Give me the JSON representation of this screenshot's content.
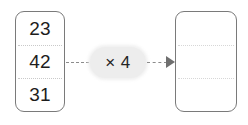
{
  "diagram": {
    "input_box": {
      "name": "input-values",
      "cells": [
        {
          "value": "23"
        },
        {
          "value": "42"
        },
        {
          "value": "31"
        }
      ]
    },
    "operator": {
      "label": "× 4",
      "symbol": "×",
      "factor": "4"
    },
    "output_box": {
      "name": "output-values",
      "cells": [
        {
          "value": ""
        },
        {
          "value": ""
        },
        {
          "value": ""
        }
      ]
    },
    "connectors": {
      "input_arrow": "dashed-line",
      "output_arrow": "dashed-line-with-arrowhead"
    },
    "colors": {
      "box_border": "#7a7a7a",
      "divider": "#c9c9c9",
      "pill_fill": "#ededed",
      "text": "#1d1d1d",
      "connector": "#8c8c8c",
      "background": "#ffffff"
    }
  }
}
